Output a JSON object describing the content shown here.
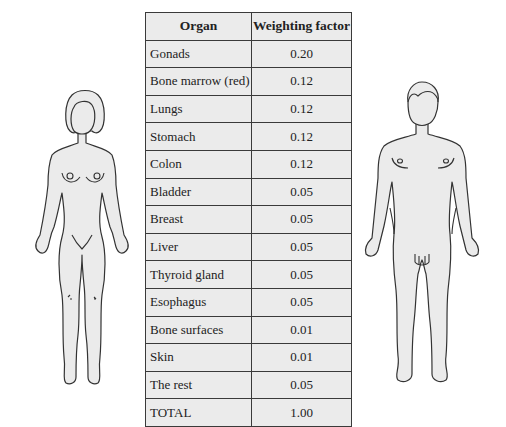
{
  "table": {
    "headers": {
      "organ": "Organ",
      "factor": "Weighting factor"
    },
    "rows": [
      {
        "organ": "Gonads",
        "factor": "0.20"
      },
      {
        "organ": "Bone marrow (red)",
        "factor": "0.12"
      },
      {
        "organ": "Lungs",
        "factor": "0.12"
      },
      {
        "organ": "Stomach",
        "factor": "0.12"
      },
      {
        "organ": "Colon",
        "factor": "0.12"
      },
      {
        "organ": "Bladder",
        "factor": "0.05"
      },
      {
        "organ": "Breast",
        "factor": "0.05"
      },
      {
        "organ": "Liver",
        "factor": "0.05"
      },
      {
        "organ": "Thyroid gland",
        "factor": "0.05"
      },
      {
        "organ": "Esophagus",
        "factor": "0.05"
      },
      {
        "organ": "Bone surfaces",
        "factor": "0.01"
      },
      {
        "organ": "Skin",
        "factor": "0.01"
      },
      {
        "organ": "The rest",
        "factor": "0.05"
      },
      {
        "organ": "TOTAL",
        "factor": "1.00"
      }
    ]
  },
  "figures": {
    "left": "female-body-outline",
    "right": "male-body-outline",
    "fill": "#ebebeb",
    "stroke": "#333333"
  }
}
